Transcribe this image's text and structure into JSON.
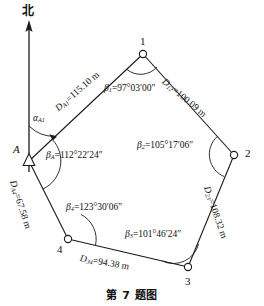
{
  "caption": "第 7 题图",
  "north": {
    "label": "北",
    "icon": "north-arrow-icon"
  },
  "vertices": [
    {
      "id": "A",
      "label": "A",
      "marker": "triangle",
      "x": 29,
      "y": 161
    },
    {
      "id": "1",
      "label": "1",
      "marker": "circle",
      "x": 143,
      "y": 54
    },
    {
      "id": "2",
      "label": "2",
      "marker": "circle",
      "x": 234,
      "y": 155
    },
    {
      "id": "3",
      "label": "3",
      "marker": "circle",
      "x": 188,
      "y": 267
    },
    {
      "id": "4",
      "label": "4",
      "marker": "circle",
      "x": 68,
      "y": 239
    }
  ],
  "sides": [
    {
      "id": "A1",
      "label": "D",
      "sub": "A1",
      "value": "115.10",
      "unit": "m",
      "text": "D_A1=115.10 m"
    },
    {
      "id": "12",
      "label": "D",
      "sub": "12",
      "value": "100.09",
      "unit": "m",
      "text": "D_12=100.09 m"
    },
    {
      "id": "23",
      "label": "D",
      "sub": "23",
      "value": "108.32",
      "unit": "m",
      "text": "D_23=108.32 m"
    },
    {
      "id": "34",
      "label": "D",
      "sub": "34",
      "value": "94.38",
      "unit": "m",
      "text": "D_34=94.38 m"
    },
    {
      "id": "A4",
      "label": "D",
      "sub": "A4",
      "value": "67.58",
      "unit": "m",
      "text": "D_A4=67.58 m"
    }
  ],
  "angles": [
    {
      "id": "beta1",
      "symbol": "β",
      "sub": "1",
      "value": "97°03′00″",
      "text": "β1=97°03′00″"
    },
    {
      "id": "beta2",
      "symbol": "β",
      "sub": "2",
      "value": "105°17′06″",
      "text": "β2=105°17′06″"
    },
    {
      "id": "beta3",
      "symbol": "β",
      "sub": "3",
      "value": "101°46′24″",
      "text": "β3=101°46′24″"
    },
    {
      "id": "beta4",
      "symbol": "β",
      "sub": "4",
      "value": "123°30′06″",
      "text": "β4=123°30′06″"
    },
    {
      "id": "betaA",
      "symbol": "β",
      "sub": "A",
      "value": "112°22′24″",
      "text": "βA=112°22′24″"
    }
  ],
  "azimuth": {
    "symbol": "α",
    "sub": "A1",
    "text": "αA1"
  },
  "colors": {
    "line": "#1a1a1a",
    "text": "#111111",
    "background": "#ffffff"
  }
}
